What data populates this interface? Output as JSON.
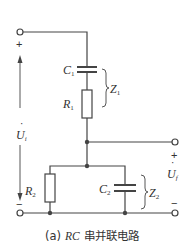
{
  "figure": {
    "caption_prefix": "(a)",
    "caption_rc": "RC",
    "caption_text": "串并联电路"
  },
  "components": {
    "C1": {
      "letter": "C",
      "sub": "1"
    },
    "R1": {
      "letter": "R",
      "sub": "1"
    },
    "R2": {
      "letter": "R",
      "sub": "2"
    },
    "C2": {
      "letter": "C",
      "sub": "2"
    },
    "Z1": {
      "letter": "Z",
      "sub": "1"
    },
    "Z2": {
      "letter": "Z",
      "sub": "2"
    }
  },
  "ports": {
    "input": {
      "letter": "U",
      "sub": "i",
      "dot": "·",
      "plus": "+",
      "minus": "−"
    },
    "output": {
      "letter": "U",
      "sub": "f",
      "dot": "·",
      "plus": "+",
      "minus": "−"
    }
  },
  "colors": {
    "wire": "#444444",
    "text": "#333333",
    "background": "#ffffff"
  }
}
